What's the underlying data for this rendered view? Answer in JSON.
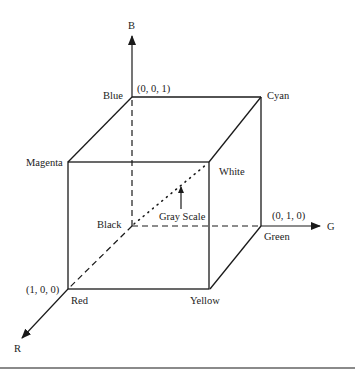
{
  "diagram": {
    "type": "RGB color cube",
    "axes": {
      "b_label": "B",
      "g_label": "G",
      "r_label": "R"
    },
    "vertices": {
      "black": "Black",
      "blue": "Blue",
      "cyan": "Cyan",
      "magenta": "Magenta",
      "white": "White",
      "red": "Red",
      "yellow": "Yellow",
      "green": "Green"
    },
    "coordinates": {
      "blue": "(0, 0, 1)",
      "green": "(0, 1, 0)",
      "red": "(1, 0, 0)"
    },
    "annotation": {
      "gray_scale": "Gray Scale"
    }
  }
}
